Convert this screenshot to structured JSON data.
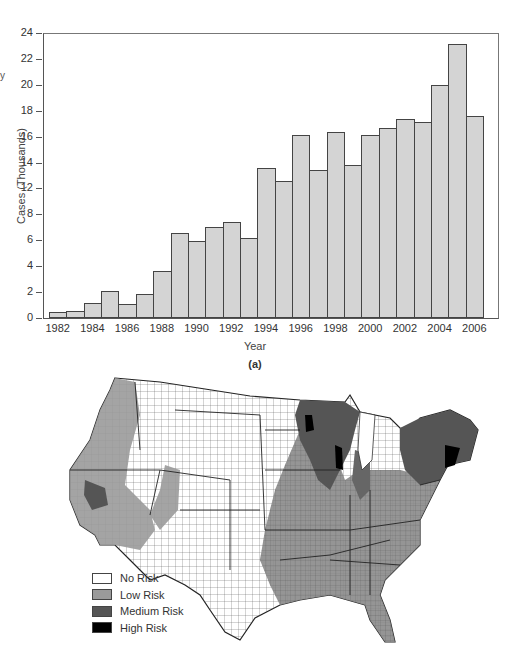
{
  "fragment_text": "y",
  "chart_data": {
    "type": "bar",
    "title": "",
    "panel_label": "(a)",
    "xlabel": "Year",
    "ylabel": "Cases (Thousands)",
    "ylim": [
      0,
      24
    ],
    "grid": false,
    "y_tick_labels": [
      "0",
      "2",
      "4",
      "6",
      "8",
      "12",
      "14",
      "16",
      "18",
      "20",
      "22",
      "24"
    ],
    "x_tick_labels": [
      "1982",
      "1984",
      "1986",
      "1988",
      "1990",
      "1992",
      "1994",
      "1996",
      "1998",
      "2000",
      "2002",
      "2004",
      "2006"
    ],
    "categories": [
      "1982",
      "1983",
      "1984",
      "1985",
      "1986",
      "1987",
      "1988",
      "1989",
      "1990",
      "1991",
      "1992",
      "1993",
      "1994",
      "1995",
      "1996",
      "1997",
      "1998",
      "1999",
      "2000",
      "2001",
      "2002",
      "2003",
      "2004",
      "2005",
      "2006"
    ],
    "values": [
      0.5,
      0.6,
      1.3,
      2.3,
      1.2,
      2.0,
      4.0,
      7.2,
      6.5,
      7.7,
      8.1,
      6.7,
      12.6,
      11.5,
      15.4,
      12.5,
      15.7,
      12.9,
      15.4,
      16.0,
      16.8,
      16.5,
      19.6,
      23.1,
      17.0
    ],
    "bar_color": "#d4d4d4",
    "bar_edge_color": "#444444"
  },
  "map": {
    "title": "",
    "legend": [
      {
        "label": "No Risk",
        "color": "#ffffff"
      },
      {
        "label": "Low Risk",
        "color": "#9a9a9a"
      },
      {
        "label": "Medium Risk",
        "color": "#555555"
      },
      {
        "label": "High Risk",
        "color": "#000000"
      }
    ]
  }
}
